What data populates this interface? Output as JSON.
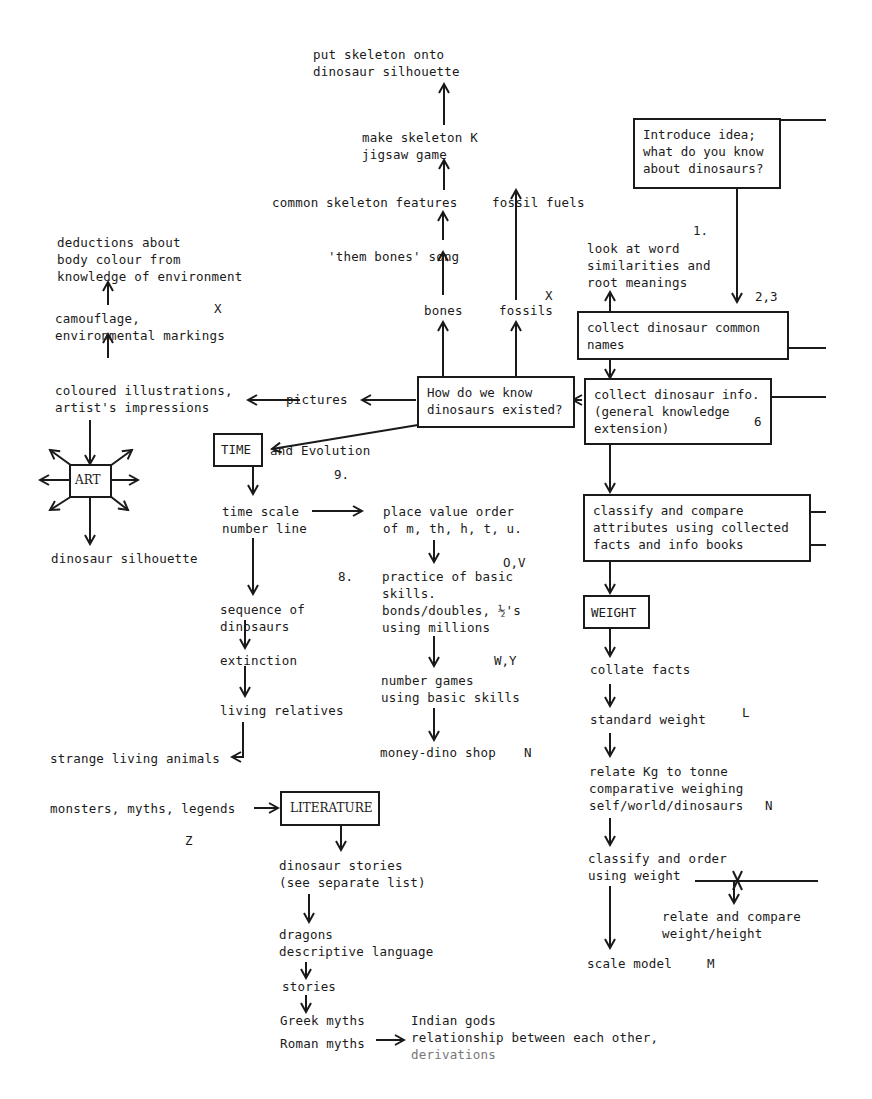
{
  "diagram": {
    "nodes": {
      "put_skeleton": "put skeleton onto\ndinosaur silhouette",
      "make_skeleton": "make skeleton K\njigsaw game",
      "common_skeleton": "common skeleton features",
      "fossil_fuels": "fossil fuels",
      "them_bones": "'them bones' song",
      "bones": "bones",
      "fossils": "fossils",
      "fossils_code": "X",
      "introduce_idea": "Introduce idea;\nwhat do you know\nabout dinosaurs?",
      "step_1": "1.",
      "look_at_word": "look at word\nsimilarities and\nroot meanings",
      "step_2_3": "2,3",
      "collect_names": "collect dinosaur common\nnames",
      "collect_info": "collect dinosaur info.\n(general knowledge\nextension)",
      "collect_info_code": "6",
      "how_do_we_know": "How do we know\ndinosaurs existed?",
      "deductions": "deductions about\nbody colour from\nknowledge of environment",
      "deductions_code": "X",
      "camouflage": "camouflage,\nenvironmental markings",
      "coloured_illustrations": "coloured illustrations,\nartist's impressions",
      "pictures": "pictures",
      "art": "ART",
      "dinosaur_silhouette": "dinosaur silhouette",
      "time": "TIME",
      "and_evolution": "and Evolution",
      "step_9": "9.",
      "time_scale": "time scale\nnumber line",
      "place_value": "place value order\nof m, th, h, t, u.",
      "place_value_code": "O,V",
      "step_8": "8.",
      "practice_skills": "practice of basic\nskills.\nbonds/doubles, ½'s\nusing millions",
      "number_games_code": "W,Y",
      "number_games": "number games\nusing basic skills",
      "money_shop": "money-dino shop",
      "money_shop_code": "N",
      "sequence": "sequence of\ndinosaurs",
      "extinction": "extinction",
      "living_relatives": "living relatives",
      "strange_animals": "strange living animals",
      "monsters": "monsters, myths, legends",
      "literature": "LITERATURE",
      "literature_code": "Z",
      "dino_stories": "dinosaur stories\n(see separate list)",
      "dragons": "dragons\ndescriptive language",
      "stories": "stories",
      "greek_myths": "Greek myths",
      "roman_myths": "Roman myths",
      "indian_gods": "Indian gods\nrelationship between each other,",
      "derivations": "derivations",
      "classify_compare": "classify and compare\nattributes using collected\nfacts and info books",
      "weight": "WEIGHT",
      "collate_facts": "collate facts",
      "standard_weight": "standard weight",
      "standard_weight_code": "L",
      "relate_kg": "relate Kg to tonne\ncomparative weighing\nself/world/dinosaurs",
      "relate_kg_code": "N",
      "classify_order": "classify and order\nusing weight",
      "relate_compare": "relate and compare\nweight/height",
      "scale_model": "scale model",
      "scale_model_code": "M"
    }
  }
}
